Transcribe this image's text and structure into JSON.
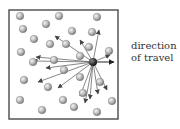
{
  "diagram": {
    "label_line1": "direction",
    "label_line2": "of travel",
    "box": {
      "x": 9,
      "y": 10,
      "w": 109,
      "h": 109
    },
    "moving_particle": {
      "x": 93,
      "y": 62
    },
    "travel_arrow_end": {
      "x": 114,
      "y": 62
    },
    "spheres": [
      [
        20,
        16
      ],
      [
        23,
        29
      ],
      [
        46,
        24
      ],
      [
        59,
        16
      ],
      [
        97,
        17
      ],
      [
        34,
        39
      ],
      [
        72,
        31
      ],
      [
        92,
        32
      ],
      [
        21,
        52
      ],
      [
        50,
        44
      ],
      [
        66,
        44
      ],
      [
        89,
        47
      ],
      [
        109,
        51
      ],
      [
        33,
        62
      ],
      [
        54,
        60
      ],
      [
        80,
        56
      ],
      [
        64,
        70
      ],
      [
        24,
        80
      ],
      [
        48,
        87
      ],
      [
        80,
        77
      ],
      [
        100,
        82
      ],
      [
        20,
        100
      ],
      [
        63,
        100
      ],
      [
        83,
        93
      ],
      [
        74,
        107
      ],
      [
        112,
        101
      ],
      [
        42,
        110
      ],
      [
        97,
        112
      ]
    ],
    "scatter_arrows": [
      [
        55,
        36
      ],
      [
        80,
        40
      ],
      [
        99,
        30
      ],
      [
        110,
        55
      ],
      [
        36,
        57
      ],
      [
        33,
        61
      ],
      [
        46,
        68
      ],
      [
        38,
        82
      ],
      [
        58,
        88
      ],
      [
        80,
        96
      ],
      [
        90,
        99
      ],
      [
        98,
        94
      ],
      [
        107,
        90
      ],
      [
        85,
        103
      ]
    ]
  }
}
